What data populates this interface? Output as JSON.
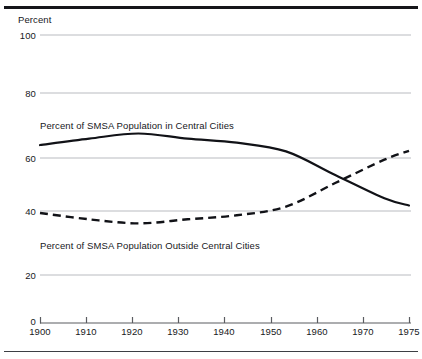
{
  "figure": {
    "clipped_caption": "",
    "y_axis_unit_label": "Percent"
  },
  "axes": {
    "y_ticks": [
      "0",
      "20",
      "40",
      "60",
      "80",
      "100"
    ],
    "x_ticks": [
      "1900",
      "1910",
      "1920",
      "1930",
      "1940",
      "1950",
      "1960",
      "1970",
      "1975"
    ]
  },
  "annotations": {
    "central_cities_label": "Percent of SMSA Population in Central Cities",
    "outside_central_cities_label": "Percent of SMSA Population Outside Central  Cities"
  },
  "colors": {
    "line": "#111217",
    "grid": "#b9bbc0",
    "axis": "#5a5c61",
    "rule": "#15161a",
    "background": "#ffffff"
  },
  "chart_data": {
    "type": "line",
    "title": "",
    "subtitle": "",
    "xlabel": "",
    "ylabel": "Percent",
    "xlim": [
      1900,
      1975
    ],
    "ylim": [
      0,
      100
    ],
    "grid": true,
    "grid_axis": "y",
    "legend": "inline-labels",
    "x": [
      1900,
      1910,
      1920,
      1930,
      1940,
      1950,
      1960,
      1970,
      1975
    ],
    "series": [
      {
        "name": "Percent of SMSA Population in Central Cities",
        "style": "solid",
        "color": "#111217",
        "values": [
          61.8,
          64.0,
          65.8,
          64.0,
          62.6,
          59.6,
          51.4,
          43.3,
          40.8
        ]
      },
      {
        "name": "Percent of SMSA Population Outside Central Cities",
        "style": "dashed",
        "color": "#111217",
        "values": [
          38.2,
          36.0,
          34.6,
          36.0,
          37.4,
          40.4,
          48.6,
          56.7,
          59.8
        ]
      }
    ]
  }
}
